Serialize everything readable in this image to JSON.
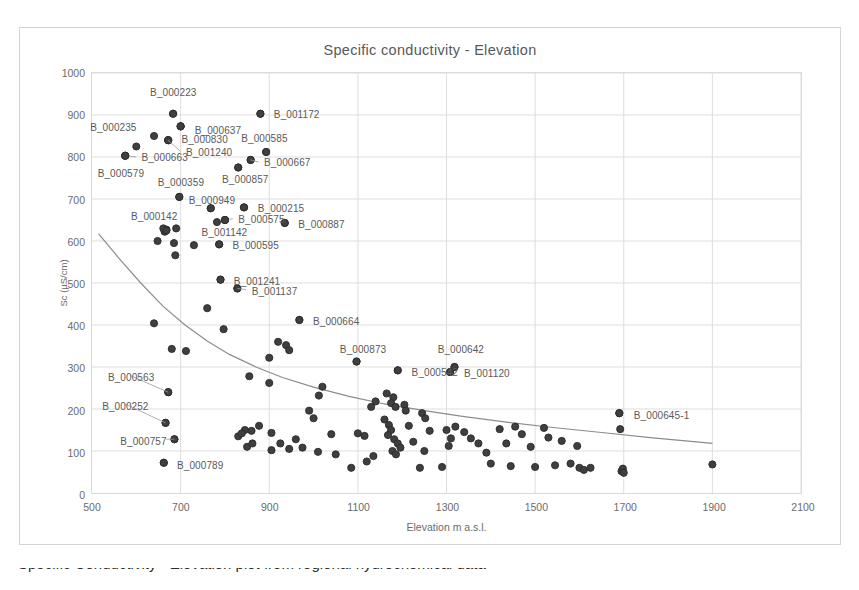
{
  "chart_data": {
    "type": "scatter",
    "title": "Specific conductivity - Elevation",
    "xlabel": "Elevation m a.s.l.",
    "ylabel": "Sc (µS/cm)",
    "xlim": [
      500,
      2100
    ],
    "ylim": [
      0,
      1000
    ],
    "xticks": [
      500,
      700,
      900,
      1100,
      1300,
      1500,
      1700,
      1900,
      2100
    ],
    "xtick_labels": [
      "500",
      "700",
      "900",
      "1100",
      "1300",
      "1500",
      "1700",
      "1900",
      "2100"
    ],
    "yticks": [
      0,
      100,
      200,
      300,
      400,
      500,
      600,
      700,
      800,
      900,
      1000
    ],
    "ytick_labels": [
      "0",
      "100",
      "200",
      "300",
      "400",
      "500",
      "600",
      "700",
      "800",
      "900",
      "1000"
    ],
    "grid": true,
    "legend": "none",
    "marker_color": "#3f3f3f",
    "trendline_color": "#8c8c8c",
    "grid_color": "#dedede",
    "trendline": {
      "type": "power-decay",
      "points": [
        [
          515,
          617
        ],
        [
          560,
          560
        ],
        [
          610,
          500
        ],
        [
          660,
          445
        ],
        [
          710,
          400
        ],
        [
          760,
          362
        ],
        [
          810,
          330
        ],
        [
          870,
          300
        ],
        [
          930,
          275
        ],
        [
          1000,
          252
        ],
        [
          1080,
          230
        ],
        [
          1160,
          212
        ],
        [
          1250,
          196
        ],
        [
          1340,
          182
        ],
        [
          1440,
          168
        ],
        [
          1540,
          156
        ],
        [
          1650,
          144
        ],
        [
          1760,
          132
        ],
        [
          1900,
          118
        ]
      ]
    },
    "labeled_points": [
      {
        "label": "B_000223",
        "x": 683,
        "y": 903,
        "lx": 683,
        "ly": 955,
        "anchor": "middle",
        "leader": false
      },
      {
        "label": "B_001172",
        "x": 880,
        "y": 903,
        "lx": 898,
        "ly": 903,
        "anchor": "start",
        "leader": false
      },
      {
        "label": "B_000235",
        "x": 700,
        "y": 873,
        "lx": 548,
        "ly": 872,
        "anchor": "middle",
        "leader": false
      },
      {
        "label": "B_000637",
        "x": 700,
        "y": 873,
        "lx": 720,
        "ly": 866,
        "anchor": "start",
        "leader": false
      },
      {
        "label": "B_000830",
        "x": 672,
        "y": 840,
        "lx": 690,
        "ly": 843,
        "anchor": "start",
        "leader": false
      },
      {
        "label": "B_001240",
        "x": 672,
        "y": 840,
        "lx": 700,
        "ly": 813,
        "anchor": "start",
        "leader": true
      },
      {
        "label": "B_000585",
        "x": 893,
        "y": 812,
        "lx": 888,
        "ly": 846,
        "anchor": "middle",
        "leader": false
      },
      {
        "label": "B_000663",
        "x": 575,
        "y": 803,
        "lx": 600,
        "ly": 800,
        "anchor": "start",
        "leader": true
      },
      {
        "label": "B_000579",
        "x": 575,
        "y": 803,
        "lx": 565,
        "ly": 762,
        "anchor": "middle",
        "leader": false
      },
      {
        "label": "B_000667",
        "x": 858,
        "y": 793,
        "lx": 876,
        "ly": 788,
        "anchor": "start",
        "leader": true
      },
      {
        "label": "B_000857",
        "x": 830,
        "y": 775,
        "lx": 845,
        "ly": 750,
        "anchor": "middle",
        "leader": false
      },
      {
        "label": "B_000359",
        "x": 697,
        "y": 705,
        "lx": 700,
        "ly": 742,
        "anchor": "middle",
        "leader": false
      },
      {
        "label": "B_000949",
        "x": 768,
        "y": 678,
        "lx": 770,
        "ly": 700,
        "anchor": "middle",
        "leader": false
      },
      {
        "label": "B_000215",
        "x": 843,
        "y": 680,
        "lx": 862,
        "ly": 680,
        "anchor": "start",
        "leader": false
      },
      {
        "label": "B_000142",
        "x": 668,
        "y": 625,
        "lx": 640,
        "ly": 661,
        "anchor": "middle",
        "leader": false
      },
      {
        "label": "B_000575",
        "x": 800,
        "y": 650,
        "lx": 818,
        "ly": 653,
        "anchor": "start",
        "leader": true
      },
      {
        "label": "B_000887",
        "x": 935,
        "y": 643,
        "lx": 953,
        "ly": 643,
        "anchor": "start",
        "leader": false
      },
      {
        "label": "B_001142",
        "x": 800,
        "y": 650,
        "lx": 798,
        "ly": 623,
        "anchor": "middle",
        "leader": false
      },
      {
        "label": "B_000595",
        "x": 787,
        "y": 592,
        "lx": 805,
        "ly": 592,
        "anchor": "start",
        "leader": false
      },
      {
        "label": "B_001241",
        "x": 790,
        "y": 508,
        "lx": 808,
        "ly": 508,
        "anchor": "start",
        "leader": false
      },
      {
        "label": "B_001137",
        "x": 828,
        "y": 487,
        "lx": 848,
        "ly": 484,
        "anchor": "start",
        "leader": true
      },
      {
        "label": "B_000664",
        "x": 968,
        "y": 412,
        "lx": 986,
        "ly": 412,
        "anchor": "start",
        "leader": false
      },
      {
        "label": "B_000873",
        "x": 1097,
        "y": 313,
        "lx": 1110,
        "ly": 345,
        "anchor": "middle",
        "leader": false
      },
      {
        "label": "B_000642",
        "x": 1318,
        "y": 300,
        "lx": 1330,
        "ly": 345,
        "anchor": "middle",
        "leader": false
      },
      {
        "label": "B_000542",
        "x": 1190,
        "y": 292,
        "lx": 1208,
        "ly": 292,
        "anchor": "start",
        "leader": false
      },
      {
        "label": "B_001120",
        "x": 1308,
        "y": 288,
        "lx": 1326,
        "ly": 288,
        "anchor": "start",
        "leader": false
      },
      {
        "label": "B_000645-1",
        "x": 1690,
        "y": 190,
        "lx": 1708,
        "ly": 190,
        "anchor": "start",
        "leader": false
      },
      {
        "label": "B_000563",
        "x": 672,
        "y": 240,
        "lx": 588,
        "ly": 279,
        "anchor": "middle",
        "leader": true
      },
      {
        "label": "B_000252",
        "x": 666,
        "y": 167,
        "lx": 575,
        "ly": 212,
        "anchor": "middle",
        "leader": true
      },
      {
        "label": "B_000757",
        "x": 686,
        "y": 128,
        "lx": 668,
        "ly": 128,
        "anchor": "end",
        "leader": true
      },
      {
        "label": "B_000789",
        "x": 662,
        "y": 72,
        "lx": 680,
        "ly": 72,
        "anchor": "start",
        "leader": false
      }
    ],
    "points": [
      [
        683,
        903
      ],
      [
        880,
        903
      ],
      [
        700,
        873
      ],
      [
        640,
        850
      ],
      [
        672,
        840
      ],
      [
        600,
        825
      ],
      [
        575,
        803
      ],
      [
        893,
        812
      ],
      [
        858,
        793
      ],
      [
        830,
        775
      ],
      [
        697,
        705
      ],
      [
        843,
        680
      ],
      [
        768,
        678
      ],
      [
        935,
        643
      ],
      [
        782,
        645
      ],
      [
        800,
        650
      ],
      [
        668,
        627
      ],
      [
        664,
        622
      ],
      [
        661,
        630
      ],
      [
        690,
        630
      ],
      [
        648,
        600
      ],
      [
        685,
        595
      ],
      [
        730,
        590
      ],
      [
        787,
        592
      ],
      [
        688,
        566
      ],
      [
        790,
        508
      ],
      [
        828,
        487
      ],
      [
        760,
        440
      ],
      [
        640,
        404
      ],
      [
        797,
        390
      ],
      [
        968,
        412
      ],
      [
        920,
        360
      ],
      [
        938,
        352
      ],
      [
        945,
        340
      ],
      [
        680,
        343
      ],
      [
        712,
        338
      ],
      [
        900,
        322
      ],
      [
        1097,
        313
      ],
      [
        1190,
        292
      ],
      [
        1308,
        288
      ],
      [
        1318,
        300
      ],
      [
        855,
        278
      ],
      [
        900,
        262
      ],
      [
        672,
        240
      ],
      [
        1020,
        253
      ],
      [
        1012,
        232
      ],
      [
        1165,
        237
      ],
      [
        1180,
        228
      ],
      [
        1175,
        214
      ],
      [
        1185,
        205
      ],
      [
        666,
        167
      ],
      [
        990,
        196
      ],
      [
        1000,
        178
      ],
      [
        845,
        150
      ],
      [
        860,
        148
      ],
      [
        877,
        160
      ],
      [
        905,
        143
      ],
      [
        1690,
        190
      ],
      [
        1692,
        152
      ],
      [
        960,
        128
      ],
      [
        1040,
        140
      ],
      [
        1160,
        175
      ],
      [
        1170,
        162
      ],
      [
        1175,
        150
      ],
      [
        1168,
        138
      ],
      [
        1182,
        128
      ],
      [
        1190,
        118
      ],
      [
        1196,
        108
      ],
      [
        1178,
        100
      ],
      [
        1186,
        92
      ],
      [
        1215,
        160
      ],
      [
        1225,
        122
      ],
      [
        1245,
        190
      ],
      [
        1252,
        178
      ],
      [
        1262,
        148
      ],
      [
        1300,
        150
      ],
      [
        1310,
        130
      ],
      [
        1320,
        158
      ],
      [
        1305,
        112
      ],
      [
        1250,
        100
      ],
      [
        1240,
        60
      ],
      [
        1290,
        62
      ],
      [
        1340,
        145
      ],
      [
        1355,
        130
      ],
      [
        1372,
        118
      ],
      [
        1390,
        96
      ],
      [
        1400,
        70
      ],
      [
        1420,
        152
      ],
      [
        1435,
        118
      ],
      [
        1445,
        64
      ],
      [
        1455,
        158
      ],
      [
        1470,
        140
      ],
      [
        1490,
        110
      ],
      [
        1500,
        62
      ],
      [
        1520,
        155
      ],
      [
        1530,
        132
      ],
      [
        1545,
        66
      ],
      [
        1560,
        124
      ],
      [
        1580,
        70
      ],
      [
        1595,
        112
      ],
      [
        1600,
        60
      ],
      [
        1610,
        55
      ],
      [
        1625,
        60
      ],
      [
        1695,
        52
      ],
      [
        1698,
        58
      ],
      [
        1700,
        48
      ],
      [
        1900,
        68
      ],
      [
        686,
        128
      ],
      [
        662,
        72
      ],
      [
        1085,
        60
      ],
      [
        1100,
        142
      ],
      [
        1115,
        136
      ],
      [
        830,
        135
      ],
      [
        838,
        142
      ],
      [
        850,
        110
      ],
      [
        862,
        118
      ],
      [
        905,
        102
      ],
      [
        925,
        118
      ],
      [
        945,
        105
      ],
      [
        975,
        108
      ],
      [
        1010,
        98
      ],
      [
        1050,
        92
      ],
      [
        1120,
        75
      ],
      [
        1135,
        88
      ],
      [
        1205,
        210
      ],
      [
        1208,
        196
      ],
      [
        1130,
        205
      ],
      [
        1140,
        218
      ]
    ]
  }
}
